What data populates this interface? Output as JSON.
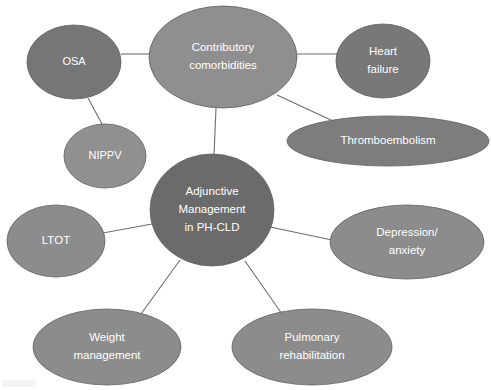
{
  "diagram": {
    "type": "mind-map",
    "background_color": "#ffffff",
    "edge_color": "#6e6e6e",
    "label_color": "#ffffff",
    "center": {
      "id": "center",
      "label_lines": [
        "Adjunctive",
        "Management",
        "in PH-CLD"
      ],
      "shape": "circle",
      "cx": 212,
      "cy": 210,
      "rx": 62,
      "ry": 56,
      "fill": "#6b6b6b",
      "font_size": 11.5
    },
    "nodes": [
      {
        "id": "osa",
        "label_lines": [
          "OSA"
        ],
        "shape": "ellipse",
        "cx": 74,
        "cy": 62,
        "rx": 47,
        "ry": 37,
        "fill": "#767676",
        "font_size": 11
      },
      {
        "id": "contributory-comorbidities",
        "label_lines": [
          "Contributory",
          "comorbidities"
        ],
        "shape": "ellipse",
        "cx": 223,
        "cy": 57,
        "rx": 74,
        "ry": 51,
        "fill": "#8f8f8f",
        "font_size": 11.5
      },
      {
        "id": "heart-failure",
        "label_lines": [
          "Heart",
          "failure"
        ],
        "shape": "ellipse",
        "cx": 383,
        "cy": 61,
        "rx": 47,
        "ry": 37,
        "fill": "#787878",
        "font_size": 11.5
      },
      {
        "id": "thromboembolism",
        "label_lines": [
          "Thromboembolism"
        ],
        "shape": "ellipse",
        "cx": 388,
        "cy": 141,
        "rx": 101,
        "ry": 25,
        "fill": "#7d7d7d",
        "font_size": 11.5
      },
      {
        "id": "nippv",
        "label_lines": [
          "NIPPV"
        ],
        "shape": "ellipse",
        "cx": 105,
        "cy": 156,
        "rx": 41,
        "ry": 32,
        "fill": "#909090",
        "font_size": 11
      },
      {
        "id": "depression-anxiety",
        "label_lines": [
          "Depression/",
          "anxiety"
        ],
        "shape": "ellipse",
        "cx": 407,
        "cy": 242,
        "rx": 77,
        "ry": 37,
        "fill": "#8c8c8c",
        "font_size": 11.5
      },
      {
        "id": "ltot",
        "label_lines": [
          "LTOT"
        ],
        "shape": "ellipse",
        "cx": 56,
        "cy": 241,
        "rx": 49,
        "ry": 36,
        "fill": "#8c8c8c",
        "font_size": 11.5
      },
      {
        "id": "weight-management",
        "label_lines": [
          "Weight",
          "management"
        ],
        "shape": "ellipse",
        "cx": 107,
        "cy": 347,
        "rx": 74,
        "ry": 38,
        "fill": "#8c8c8c",
        "font_size": 11.5
      },
      {
        "id": "pulmonary-rehabilitation",
        "label_lines": [
          "Pulmonary",
          "rehabilitation"
        ],
        "shape": "ellipse",
        "cx": 312,
        "cy": 347,
        "rx": 80,
        "ry": 38,
        "fill": "#8c8c8c",
        "font_size": 11.5
      }
    ],
    "edges": [
      {
        "id": "edge-osa-comorbidities",
        "from": "osa",
        "to": "contributory-comorbidities",
        "x1": 121,
        "y1": 54,
        "x2": 151,
        "y2": 54
      },
      {
        "id": "edge-osa-nippv",
        "from": "osa",
        "to": "nippv",
        "x1": 88,
        "y1": 98,
        "x2": 102,
        "y2": 124
      },
      {
        "id": "edge-comorbidities-heart-failure",
        "from": "contributory-comorbidities",
        "to": "heart-failure",
        "x1": 294,
        "y1": 54,
        "x2": 337,
        "y2": 54
      },
      {
        "id": "edge-comorbidities-thromboembolism",
        "from": "contributory-comorbidities",
        "to": "thromboembolism",
        "x1": 277,
        "y1": 95,
        "x2": 333,
        "y2": 121
      },
      {
        "id": "edge-comorbidities-center",
        "from": "contributory-comorbidities",
        "to": "center",
        "x1": 216,
        "y1": 108,
        "x2": 214,
        "y2": 155
      },
      {
        "id": "edge-center-ltot",
        "from": "center",
        "to": "ltot",
        "x1": 152,
        "y1": 224,
        "x2": 103,
        "y2": 233
      },
      {
        "id": "edge-center-depression",
        "from": "center",
        "to": "depression-anxiety",
        "x1": 270,
        "y1": 227,
        "x2": 332,
        "y2": 240
      },
      {
        "id": "edge-center-weight",
        "from": "center",
        "to": "weight-management",
        "x1": 180,
        "y1": 260,
        "x2": 141,
        "y2": 314
      },
      {
        "id": "edge-center-pulmonary",
        "from": "center",
        "to": "pulmonary-rehabilitation",
        "x1": 245,
        "y1": 261,
        "x2": 282,
        "y2": 314
      }
    ]
  }
}
